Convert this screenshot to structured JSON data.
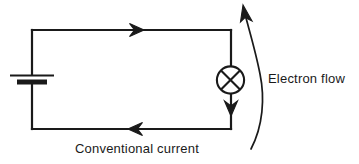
{
  "diagram": {
    "stroke_color": "#1a1a1a",
    "background_color": "#ffffff",
    "labels": {
      "electron_flow": "Electron flow",
      "conventional_current": "Conventional current"
    },
    "components": {
      "battery": {
        "name": "battery-cell",
        "position": "left side of circuit loop"
      },
      "lamp": {
        "name": "lamp-bulb",
        "symbol": "circle-with-cross",
        "position": "right side of circuit loop"
      }
    },
    "arrows": {
      "top_wire": {
        "name": "conventional-current-arrow-top",
        "direction": "right"
      },
      "bottom_wire": {
        "name": "conventional-current-arrow-bottom",
        "direction": "left"
      },
      "lamp_branch": {
        "name": "conventional-current-arrow-lamp",
        "direction": "down"
      },
      "electron_flow_curve": {
        "name": "electron-flow-curved-arrow",
        "direction": "up"
      }
    }
  }
}
